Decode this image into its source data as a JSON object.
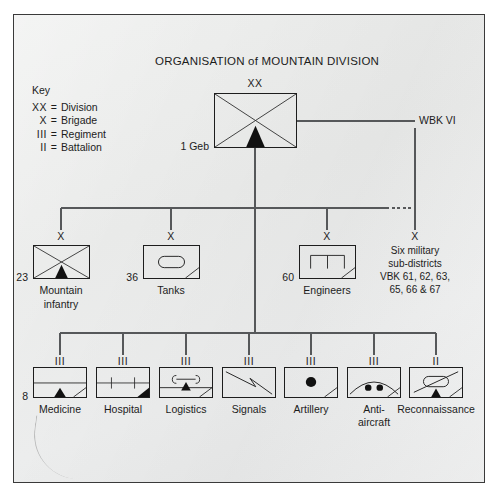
{
  "diagram": {
    "title": "ORGANISATION of  MOUNTAIN DIVISION",
    "key": {
      "heading": "Key",
      "entries": [
        {
          "symbol": "XX",
          "eq": "=",
          "meaning": "Division"
        },
        {
          "symbol": "X",
          "eq": "=",
          "meaning": "Brigade"
        },
        {
          "symbol": "III",
          "eq": "=",
          "meaning": "Regiment"
        },
        {
          "symbol": "II",
          "eq": "=",
          "meaning": "Battalion"
        }
      ]
    },
    "division": {
      "echelon": "XX",
      "designation": "1 Geb",
      "symbol": "mountain-infantry-division"
    },
    "district": {
      "label": "WBK VI"
    },
    "brigades": [
      {
        "echelon": "X",
        "designation": "23",
        "label_line1": "Mountain",
        "label_line2": "infantry",
        "symbol": "mountain-infantry"
      },
      {
        "echelon": "X",
        "designation": "36",
        "label_line1": "Tanks",
        "label_line2": "",
        "symbol": "armour"
      },
      {
        "echelon": "X",
        "designation": "60",
        "label_line1": "Engineers",
        "label_line2": "",
        "symbol": "engineers"
      }
    ],
    "sub_districts": {
      "echelon": "X",
      "line1": "Six military",
      "line2": "sub-districts",
      "line3": "VBK 61, 62, 63,",
      "line4": "65, 66 & 67"
    },
    "regiments": [
      {
        "echelon": "III",
        "designation": "8",
        "label_line1": "Medicine",
        "label_line2": "",
        "symbol": "medical-mountain"
      },
      {
        "echelon": "III",
        "designation": "",
        "label_line1": "Hospital",
        "label_line2": "",
        "symbol": "hospital"
      },
      {
        "echelon": "III",
        "designation": "",
        "label_line1": "Logistics",
        "label_line2": "",
        "symbol": "supply-mountain"
      },
      {
        "echelon": "III",
        "designation": "",
        "label_line1": "Signals",
        "label_line2": "",
        "symbol": "signals"
      },
      {
        "echelon": "III",
        "designation": "",
        "label_line1": "Artillery",
        "label_line2": "",
        "symbol": "artillery"
      },
      {
        "echelon": "III",
        "designation": "",
        "label_line1": "Anti-",
        "label_line2": "aircraft",
        "symbol": "anti-aircraft"
      },
      {
        "echelon": "II",
        "designation": "",
        "label_line1": "Reconnaissance",
        "label_line2": "",
        "symbol": "reconnaissance-mountain"
      }
    ],
    "colors": {
      "ink": "#1d1d1d",
      "line": "#4a4a4a",
      "paper": "#ebecec",
      "border": "#3a3a3a"
    }
  }
}
